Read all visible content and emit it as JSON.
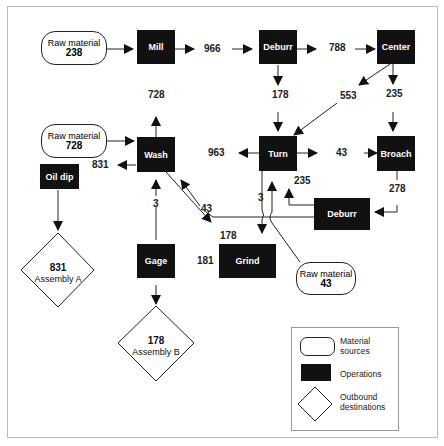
{
  "diagram": {
    "title": "",
    "sources": [
      {
        "id": "src1",
        "label": "Raw material",
        "value": "238"
      },
      {
        "id": "src2",
        "label": "Raw material",
        "value": "728"
      },
      {
        "id": "src3",
        "label": "Raw material",
        "value": "43"
      }
    ],
    "operations": [
      {
        "id": "mill",
        "label": "Mill"
      },
      {
        "id": "deburr1",
        "label": "Deburr"
      },
      {
        "id": "center",
        "label": "Center"
      },
      {
        "id": "wash",
        "label": "Wash"
      },
      {
        "id": "turn",
        "label": "Turn"
      },
      {
        "id": "broach",
        "label": "Broach"
      },
      {
        "id": "oildip",
        "label": "Oil dip"
      },
      {
        "id": "deburr2",
        "label": "Deburr"
      },
      {
        "id": "gage",
        "label": "Gage"
      },
      {
        "id": "grind",
        "label": "Grind"
      }
    ],
    "destinations": [
      {
        "id": "asmA",
        "value": "831",
        "label": "Assembly A"
      },
      {
        "id": "asmB",
        "value": "178",
        "label": "Assembly B"
      }
    ],
    "flow_labels": {
      "mill_deburr": "966",
      "deburr_center": "788",
      "deburr_turn": "178",
      "center_turn": "553",
      "center_broach": "235",
      "wash_up": "728",
      "wash_out": "831",
      "turn_wash": "963",
      "turn_broach": "43",
      "broach_deburr": "278",
      "deburr_turn_235": "235",
      "turn_grind": "3",
      "deburr_wash": "43",
      "gage_wash": "3",
      "wash_grind": "178",
      "grind_gage": "181"
    },
    "legend": {
      "items": [
        {
          "shape": "rounded-rect",
          "label": "Material sources"
        },
        {
          "shape": "black-rect",
          "label": "Operations"
        },
        {
          "shape": "diamond",
          "label": "Outbound destinations"
        }
      ]
    }
  }
}
